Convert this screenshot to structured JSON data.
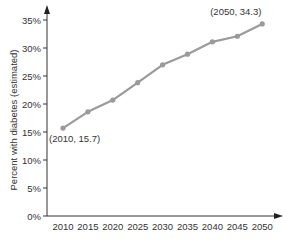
{
  "chart_data": {
    "type": "line",
    "title": "",
    "xlabel": "",
    "ylabel": "Percent with diabetes (estimated)",
    "x": [
      2010,
      2015,
      2020,
      2025,
      2030,
      2035,
      2040,
      2045,
      2050
    ],
    "categories": [
      "2010",
      "2015",
      "2020",
      "2025",
      "2030",
      "2035",
      "2040",
      "2045",
      "2050"
    ],
    "series": [
      {
        "name": "Percent with diabetes (estimated)",
        "values": [
          15.7,
          18.6,
          20.7,
          23.8,
          27.0,
          28.9,
          31.1,
          32.1,
          34.3
        ],
        "color": "#9a9a9a"
      }
    ],
    "yticks": [
      0,
      5,
      10,
      15,
      20,
      25,
      30,
      35
    ],
    "ytick_labels": [
      "0%",
      "5%",
      "10%",
      "15%",
      "20%",
      "25%",
      "30%",
      "35%"
    ],
    "ylim": [
      0,
      35
    ],
    "grid": false,
    "legend": null,
    "annotations": [
      {
        "text": "(2010, 15.7)",
        "x": 2010,
        "y": 15.7
      },
      {
        "text": "(2050, 34.3)",
        "x": 2050,
        "y": 34.3
      }
    ]
  },
  "colors": {
    "line": "#9a9a9a",
    "axis": "#333333",
    "text": "#333333"
  }
}
